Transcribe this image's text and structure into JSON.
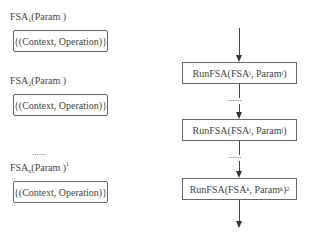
{
  "left_column": {
    "fsa_defs": [
      {
        "name": "FSA",
        "sub": "1",
        "param": "(Param )",
        "sup": "",
        "content": "{(Context, Operation)}"
      },
      {
        "name": "FSA",
        "sub": "2",
        "param": "(Param )",
        "sup": "",
        "content": "{(Context, Operation)}"
      },
      {
        "name": "FSA",
        "sub": "n",
        "param": "(Param )",
        "sup": "1",
        "content": "{(Context, Operation)}"
      }
    ],
    "ellipsis": "......"
  },
  "right_column": {
    "run_boxes": [
      {
        "func": "RunFSA(FSA",
        "fsa_sub": "i",
        "mid": ", Param",
        "param_sub": "i",
        "end": ")",
        "sup": ""
      },
      {
        "func": "RunFSA(FSA",
        "fsa_sub": "j",
        "mid": ", Param",
        "param_sub": "j",
        "end": ")",
        "sup": ""
      },
      {
        "func": "RunFSA(FSA",
        "fsa_sub": "k",
        "mid": ", Param",
        "param_sub": "k",
        "end": ")",
        "sup": "2"
      }
    ],
    "ellipsis_1": "......",
    "ellipsis_2": "......"
  }
}
